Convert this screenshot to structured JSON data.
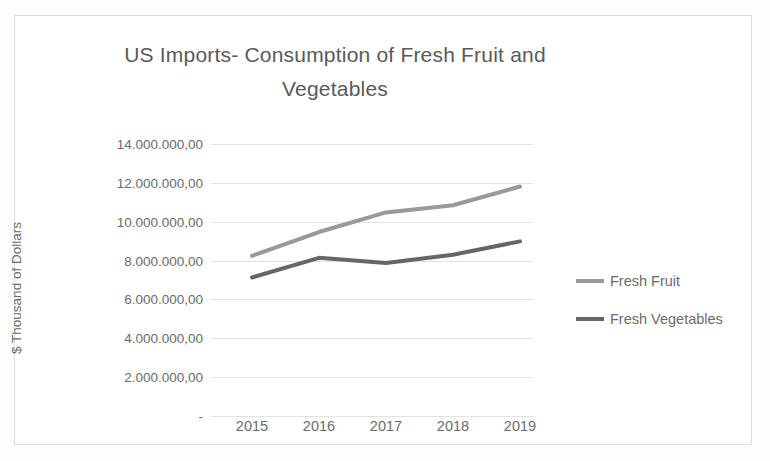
{
  "chart_data": {
    "type": "line",
    "title": "US Imports- Consumption of Fresh Fruit and Vegetables",
    "title_line1": "US Imports- Consumption of Fresh Fruit and",
    "title_line2": "Vegetables",
    "xlabel": "",
    "ylabel": "$ Thousand of Dollars",
    "categories": [
      "2015",
      "2016",
      "2017",
      "2018",
      "2019"
    ],
    "series": [
      {
        "name": "Fresh Fruit",
        "color": "#999999",
        "values": [
          8240000,
          9470000,
          10480000,
          10850000,
          11810000
        ]
      },
      {
        "name": "Fresh Vegetables",
        "color": "#666666",
        "values": [
          7130000,
          8140000,
          7870000,
          8300000,
          8990000
        ]
      }
    ],
    "ylim": [
      0,
      14000000
    ],
    "ytick_values": [
      0,
      2000000,
      4000000,
      6000000,
      8000000,
      10000000,
      12000000,
      14000000
    ],
    "ytick_labels": [
      "-",
      "2.000.000,00",
      "4.000.000,00",
      "6.000.000,00",
      "8.000.000,00",
      "10.000.000,00",
      "12.000.000,00",
      "14.000.000,00"
    ],
    "grid": true,
    "legend_position": "right",
    "legend": [
      "Fresh Fruit",
      "Fresh Vegetables"
    ]
  },
  "frame": {
    "border_color": "#dcdcdc",
    "background": "#ffffff"
  }
}
